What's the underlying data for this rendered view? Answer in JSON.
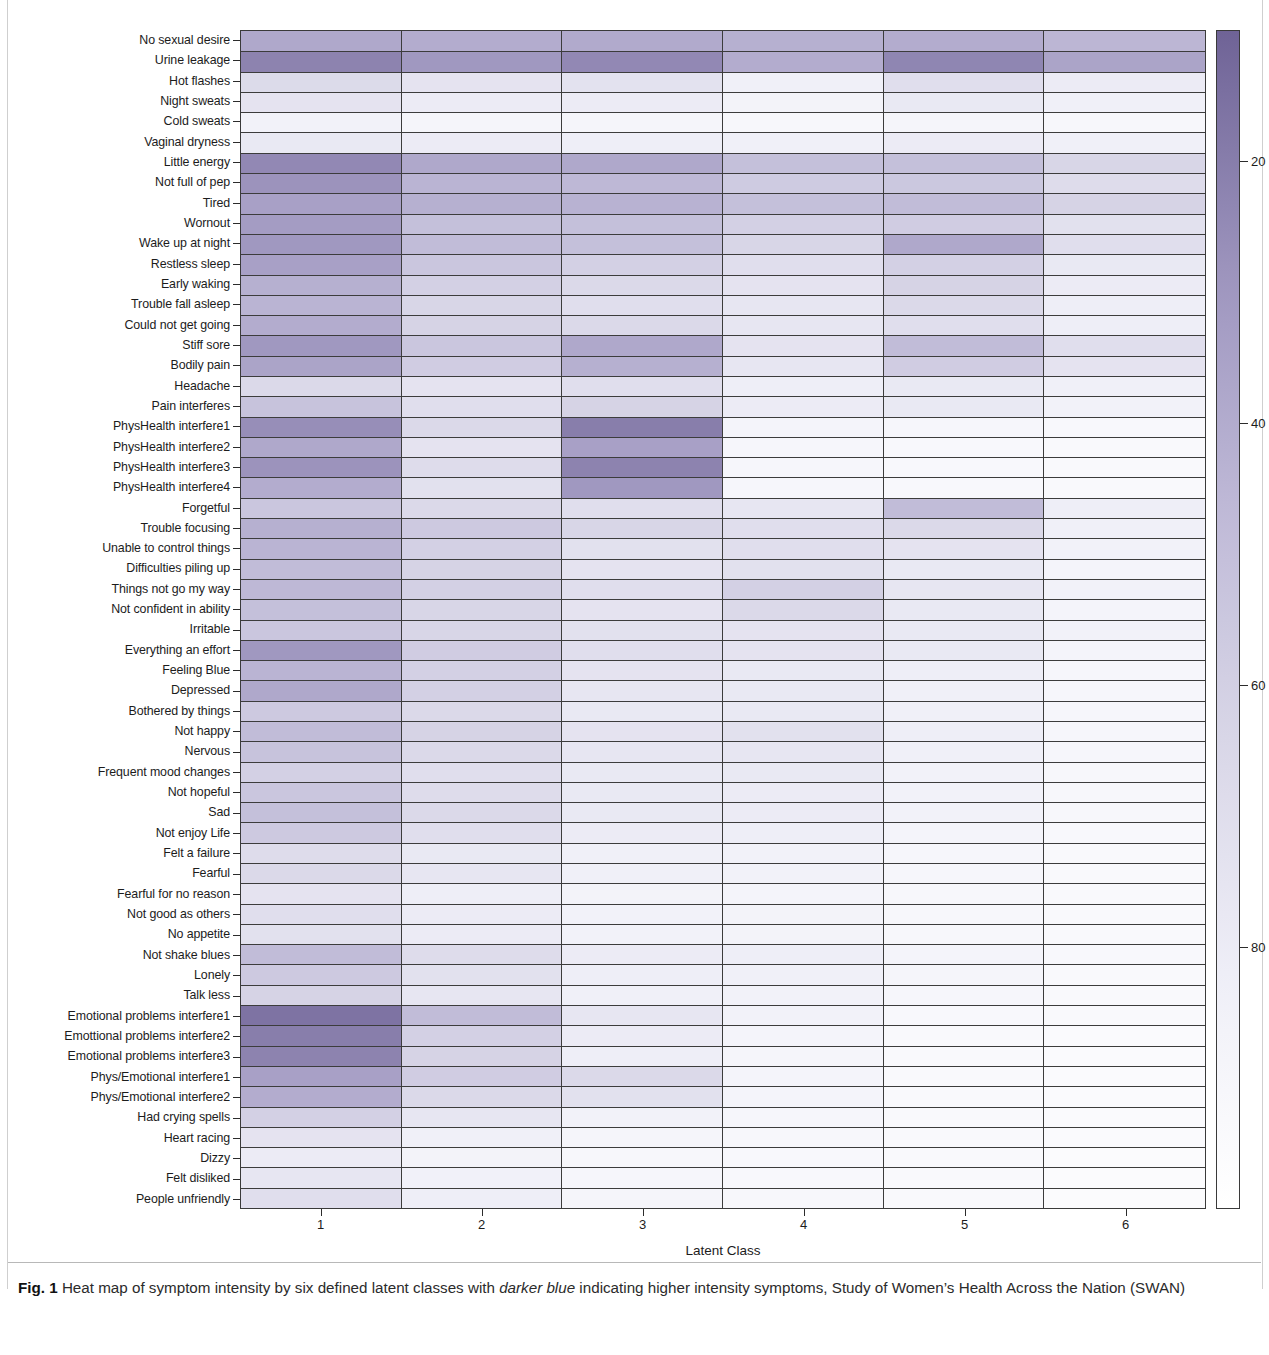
{
  "figure": {
    "xaxis_title": "Latent Class",
    "xtick_labels": [
      "1",
      "2",
      "3",
      "4",
      "5",
      "6"
    ],
    "colorbar_ticks": [
      "80",
      "60",
      "40",
      "20"
    ],
    "colorbar_dark": "#6f6396",
    "colorbar_light": "#ffffff"
  },
  "caption": {
    "figure_number": "Fig. 1",
    "text_part1": " Heat map of symptom intensity by six defined latent classes with ",
    "emphasis": "darker blue",
    "text_part2": " indicating higher intensity symptoms, Study of Women’s Health Across the Nation (SWAN)"
  },
  "chart_data": {
    "type": "heatmap",
    "title": "",
    "xlabel": "Latent Class",
    "ylabel": "",
    "grid": true,
    "legend": "colorbar-right",
    "colorbar_label": "",
    "zlim": [
      0,
      90
    ],
    "colorbar_ticks": [
      20,
      40,
      60,
      80
    ],
    "colormap": "white-to-purple (BuPu-like)",
    "x": [
      "1",
      "2",
      "3",
      "4",
      "5",
      "6"
    ],
    "y": [
      "No sexual desire",
      "Urine leakage",
      "Hot flashes",
      "Night sweats",
      "Cold sweats",
      "Vaginal dryness",
      "Little energy",
      "Not full of pep",
      "Tired",
      "Wornout",
      "Wake up at night",
      "Restless sleep",
      "Early waking",
      "Trouble fall asleep",
      "Could not get going",
      "Stiff sore",
      "Bodily pain",
      "Headache",
      "Pain interferes",
      "PhysHealth interfere1",
      "PhysHealth interfere2",
      "PhysHealth interfere3",
      "PhysHealth interfere4",
      "Forgetful",
      "Trouble focusing",
      "Unable to control things",
      "Difficulties piling up",
      "Things not go my way",
      "Not confident in ability",
      "Irritable",
      "Everything an effort",
      "Feeling Blue",
      "Depressed",
      "Bothered by things",
      "Not happy",
      "Nervous",
      "Frequent mood changes",
      "Not hopeful",
      "Sad",
      "Not enjoy Life",
      "Felt a failure",
      "Fearful",
      "Fearful for no reason",
      "Not good as others",
      "No appetite",
      "Not shake blues",
      "Lonely",
      "Talk less",
      "Emotional problems interfere1",
      "Emottional problems interfere2",
      "Emotional problems interfere3",
      "Phys/Emotional interfere1",
      "Phys/Emotional interfere2",
      "Had crying spells",
      "Heart racing",
      "Dizzy",
      "Felt disliked",
      "People unfriendly"
    ],
    "z": [
      [
        62,
        60,
        61,
        58,
        60,
        55
      ],
      [
        78,
        70,
        76,
        60,
        77,
        64
      ],
      [
        33,
        26,
        27,
        16,
        30,
        20
      ],
      [
        26,
        20,
        20,
        13,
        22,
        16
      ],
      [
        14,
        11,
        11,
        9,
        11,
        9
      ],
      [
        22,
        20,
        18,
        16,
        20,
        16
      ],
      [
        76,
        62,
        62,
        50,
        50,
        36
      ],
      [
        72,
        56,
        54,
        43,
        45,
        32
      ],
      [
        66,
        58,
        57,
        50,
        52,
        38
      ],
      [
        68,
        50,
        50,
        40,
        42,
        28
      ],
      [
        70,
        52,
        50,
        36,
        62,
        30
      ],
      [
        66,
        46,
        40,
        30,
        40,
        22
      ],
      [
        58,
        40,
        34,
        26,
        38,
        20
      ],
      [
        56,
        36,
        30,
        24,
        34,
        18
      ],
      [
        60,
        38,
        34,
        24,
        30,
        18
      ],
      [
        70,
        46,
        62,
        26,
        52,
        30
      ],
      [
        64,
        42,
        58,
        24,
        42,
        26
      ],
      [
        34,
        26,
        30,
        18,
        22,
        16
      ],
      [
        48,
        30,
        38,
        20,
        22,
        14
      ],
      [
        74,
        34,
        80,
        12,
        10,
        8
      ],
      [
        62,
        26,
        66,
        10,
        8,
        7
      ],
      [
        72,
        32,
        78,
        10,
        8,
        7
      ],
      [
        60,
        28,
        70,
        10,
        8,
        7
      ],
      [
        46,
        34,
        30,
        24,
        52,
        18
      ],
      [
        58,
        44,
        36,
        30,
        34,
        16
      ],
      [
        56,
        40,
        28,
        30,
        26,
        14
      ],
      [
        52,
        38,
        26,
        28,
        22,
        12
      ],
      [
        54,
        40,
        30,
        40,
        24,
        14
      ],
      [
        50,
        36,
        26,
        34,
        22,
        12
      ],
      [
        46,
        36,
        28,
        26,
        22,
        14
      ],
      [
        70,
        42,
        30,
        26,
        22,
        12
      ],
      [
        56,
        40,
        26,
        22,
        18,
        10
      ],
      [
        62,
        40,
        24,
        22,
        16,
        10
      ],
      [
        44,
        34,
        22,
        22,
        16,
        10
      ],
      [
        52,
        38,
        26,
        28,
        18,
        10
      ],
      [
        48,
        34,
        24,
        24,
        16,
        10
      ],
      [
        40,
        30,
        22,
        22,
        14,
        9
      ],
      [
        46,
        32,
        22,
        20,
        14,
        9
      ],
      [
        50,
        34,
        22,
        20,
        14,
        9
      ],
      [
        44,
        30,
        20,
        18,
        12,
        8
      ],
      [
        32,
        22,
        16,
        14,
        10,
        7
      ],
      [
        34,
        24,
        16,
        14,
        10,
        7
      ],
      [
        26,
        18,
        13,
        12,
        9,
        6
      ],
      [
        30,
        20,
        14,
        13,
        9,
        6
      ],
      [
        28,
        20,
        14,
        13,
        9,
        6
      ],
      [
        52,
        32,
        20,
        18,
        12,
        8
      ],
      [
        44,
        28,
        18,
        16,
        11,
        7
      ],
      [
        38,
        24,
        16,
        14,
        10,
        7
      ],
      [
        84,
        52,
        24,
        14,
        8,
        6
      ],
      [
        80,
        40,
        20,
        12,
        7,
        5
      ],
      [
        78,
        38,
        18,
        11,
        7,
        5
      ],
      [
        66,
        42,
        34,
        12,
        7,
        5
      ],
      [
        60,
        34,
        28,
        12,
        7,
        5
      ],
      [
        40,
        24,
        14,
        10,
        7,
        5
      ],
      [
        26,
        16,
        11,
        9,
        6,
        5
      ],
      [
        20,
        13,
        9,
        8,
        6,
        4
      ],
      [
        24,
        15,
        10,
        8,
        6,
        4
      ],
      [
        30,
        18,
        11,
        9,
        6,
        4
      ]
    ]
  }
}
